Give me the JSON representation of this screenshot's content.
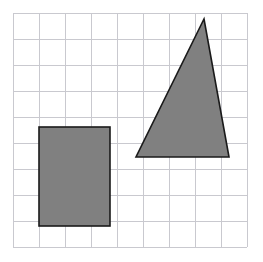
{
  "figure": {
    "background_color": "#ffffff",
    "canvas": {
      "width": 263,
      "height": 262
    }
  },
  "grid": {
    "name": "square-grid",
    "line_color": "#c9c9cf",
    "line_width": 1,
    "origin_x": 13,
    "origin_y": 13,
    "cell_size": 26,
    "columns": 9,
    "rows": 9,
    "extent_x": 247,
    "extent_y": 247
  },
  "shapes": [
    {
      "name": "rectangle",
      "type": "rect",
      "fill_color": "#808080",
      "stroke_color": "#1a1a1a",
      "stroke_width": 1.6,
      "x": 39,
      "y": 127,
      "width": 71,
      "height": 99,
      "grid_units": {
        "width": 3,
        "height": 4
      }
    },
    {
      "name": "triangle",
      "type": "polygon",
      "fill_color": "#808080",
      "stroke_color": "#1a1a1a",
      "stroke_width": 1.6,
      "points": "204,19 229,157 136,157",
      "vertices": [
        {
          "label": "apex",
          "x": 204,
          "y": 19
        },
        {
          "label": "bottom-right",
          "x": 229,
          "y": 157
        },
        {
          "label": "bottom-left",
          "x": 136,
          "y": 157
        }
      ],
      "grid_units": {
        "base": 4,
        "height": 5
      }
    }
  ]
}
